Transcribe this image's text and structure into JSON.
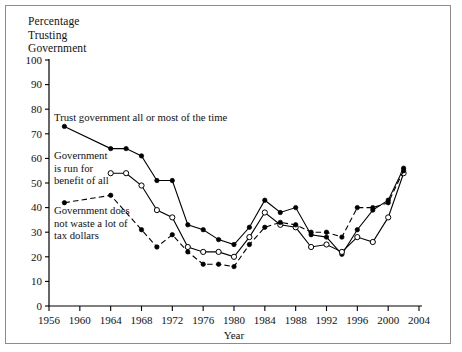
{
  "figure": {
    "y_axis_caption": "Percentage\nTrusting\nGovernment",
    "x_axis_title": "Year"
  },
  "annotations": {
    "trust": "Trust government all or most of the time",
    "benefit": "Government\nis run for\nbenefit of all",
    "waste": "Government does\nnot waste a lot of\ntax dollars"
  },
  "chart_data": {
    "type": "line",
    "title": "Percentage Trusting Government",
    "xlabel": "Year",
    "ylabel": "Percentage Trusting Government",
    "xlim": [
      1956,
      2004
    ],
    "ylim": [
      0,
      100
    ],
    "xticks": [
      1956,
      1960,
      1964,
      1968,
      1972,
      1976,
      1980,
      1984,
      1988,
      1992,
      1996,
      2000,
      2004
    ],
    "yticks": [
      0,
      10,
      20,
      30,
      40,
      50,
      60,
      70,
      80,
      90,
      100
    ],
    "grid": false,
    "legend": "inline annotations",
    "series": [
      {
        "name": "Trust government all or most of the time",
        "marker": "filled-circle",
        "linestyle": "solid",
        "points": [
          [
            1958,
            73
          ],
          [
            1964,
            64
          ],
          [
            1966,
            64
          ],
          [
            1968,
            61
          ],
          [
            1970,
            51
          ],
          [
            1972,
            51
          ],
          [
            1974,
            33
          ],
          [
            1976,
            31
          ],
          [
            1978,
            27
          ],
          [
            1980,
            25
          ],
          [
            1982,
            32
          ],
          [
            1984,
            43
          ],
          [
            1986,
            38
          ],
          [
            1988,
            40
          ],
          [
            1990,
            29
          ],
          [
            1992,
            28
          ],
          [
            1994,
            21
          ],
          [
            1996,
            31
          ],
          [
            1998,
            39
          ],
          [
            2000,
            43
          ],
          [
            2002,
            56
          ]
        ]
      },
      {
        "name": "Government is run for benefit of all",
        "marker": "open-circle",
        "linestyle": "solid",
        "points": [
          [
            1964,
            54
          ],
          [
            1966,
            54
          ],
          [
            1968,
            49
          ],
          [
            1970,
            39
          ],
          [
            1972,
            36
          ],
          [
            1974,
            24
          ],
          [
            1976,
            22
          ],
          [
            1978,
            22
          ],
          [
            1980,
            20
          ],
          [
            1982,
            28
          ],
          [
            1984,
            38
          ],
          [
            1986,
            33
          ],
          [
            1988,
            32
          ],
          [
            1990,
            24
          ],
          [
            1992,
            25
          ],
          [
            1994,
            22
          ],
          [
            1996,
            28
          ],
          [
            1998,
            26
          ],
          [
            2000,
            36
          ],
          [
            2002,
            54
          ]
        ]
      },
      {
        "name": "Government does not waste a lot of tax dollars",
        "marker": "filled-circle",
        "linestyle": "dashed",
        "points": [
          [
            1958,
            42
          ],
          [
            1964,
            45
          ],
          [
            1968,
            31
          ],
          [
            1970,
            24
          ],
          [
            1972,
            29
          ],
          [
            1974,
            22
          ],
          [
            1976,
            17
          ],
          [
            1978,
            17
          ],
          [
            1980,
            16
          ],
          [
            1982,
            25
          ],
          [
            1984,
            32
          ],
          [
            1986,
            34
          ],
          [
            1988,
            33
          ],
          [
            1990,
            30
          ],
          [
            1992,
            30
          ],
          [
            1994,
            28
          ],
          [
            1996,
            40
          ],
          [
            1998,
            40
          ],
          [
            2000,
            42
          ],
          [
            2002,
            55
          ]
        ]
      }
    ]
  }
}
